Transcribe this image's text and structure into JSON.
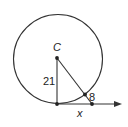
{
  "figure": {
    "labels": {
      "center": "C",
      "radius": "21",
      "external_segment": "8",
      "tangent_segment": "x"
    },
    "colors": {
      "stroke": "#333333",
      "background": "#ffffff"
    }
  }
}
